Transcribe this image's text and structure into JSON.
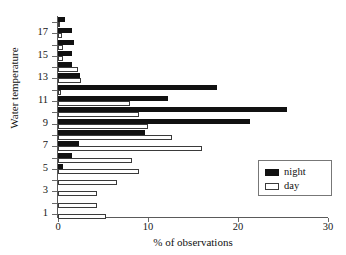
{
  "top_caption": "",
  "axes": {
    "y_title": "Water temperature",
    "x_title": "% of observations"
  },
  "legend": {
    "night_label": "night",
    "day_label": "day",
    "night_color": "#111111",
    "day_color": "#ffffff",
    "day_border_color": "#3a3a3a"
  },
  "chart_data": {
    "type": "bar",
    "orientation": "horizontal",
    "title": "",
    "subtitle": "",
    "xlabel": "% of observations",
    "ylabel": "Water temperature",
    "xlim": [
      0,
      30
    ],
    "ylim": [
      0.5,
      18.5
    ],
    "xticks": [
      0,
      10,
      20,
      30
    ],
    "xtick_labels": [
      "0",
      "10",
      "20",
      "30"
    ],
    "yticks": [
      1,
      2,
      3,
      4,
      5,
      6,
      7,
      8,
      9,
      10,
      11,
      12,
      13,
      14,
      15,
      16,
      17,
      18
    ],
    "ytick_labels": [
      "1",
      "",
      "3",
      "",
      "5",
      "",
      "7",
      "",
      "9",
      "",
      "11",
      "",
      "13",
      "",
      "15",
      "",
      "17",
      ""
    ],
    "grid": false,
    "legend_position": "lower right",
    "legend_entries": [
      "night",
      "day"
    ],
    "categories": [
      18,
      17,
      16,
      15,
      14,
      13,
      12,
      11,
      10,
      9,
      8,
      7,
      6,
      5,
      4,
      3,
      2,
      1
    ],
    "series": [
      {
        "name": "night",
        "color": "#111111",
        "values": [
          0.8,
          1.6,
          1.8,
          1.5,
          1.5,
          2.4,
          17.7,
          12.2,
          25.4,
          21.3,
          9.7,
          2.3,
          1.5,
          0.6,
          0.0,
          0.0,
          0.0,
          0.0
        ]
      },
      {
        "name": "day",
        "color": "#ffffff",
        "values": [
          0.2,
          0.4,
          0.5,
          0.6,
          2.2,
          2.5,
          0.3,
          8.0,
          9.0,
          10.0,
          12.7,
          16.0,
          8.2,
          9.0,
          6.5,
          4.3,
          4.3,
          5.3
        ]
      }
    ]
  }
}
